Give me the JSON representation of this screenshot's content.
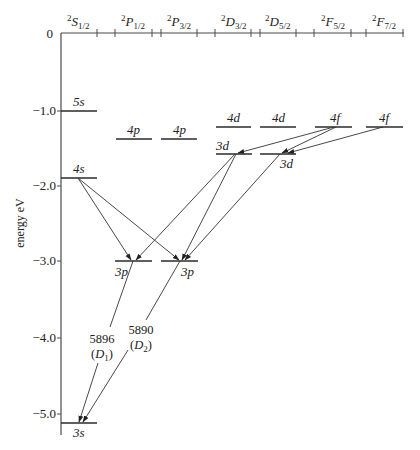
{
  "diagram": {
    "y_axis": {
      "label": "energy eV",
      "ticks": [
        {
          "label": "0",
          "value": 0
        },
        {
          "label": "−1.0",
          "value": -1.0
        },
        {
          "label": "−2.0",
          "value": -2.0
        },
        {
          "label": "−3.0",
          "value": -3.0
        },
        {
          "label": "−4.0",
          "value": -4.0
        },
        {
          "label": "−5.0",
          "value": -5.0
        }
      ]
    },
    "columns": [
      {
        "id": "S1/2",
        "sup": "2",
        "letter": "S",
        "sub": "1/2"
      },
      {
        "id": "P1/2",
        "sup": "2",
        "letter": "P",
        "sub": "1/2"
      },
      {
        "id": "P3/2",
        "sup": "2",
        "letter": "P",
        "sub": "3/2"
      },
      {
        "id": "D3/2",
        "sup": "2",
        "letter": "D",
        "sub": "3/2"
      },
      {
        "id": "D5/2",
        "sup": "2",
        "letter": "D",
        "sub": "5/2"
      },
      {
        "id": "F5/2",
        "sup": "2",
        "letter": "F",
        "sub": "5/2"
      },
      {
        "id": "F7/2",
        "sup": "2",
        "letter": "F",
        "sub": "7/2"
      }
    ],
    "levels": [
      {
        "label": "5s",
        "column": "S1/2",
        "energy_ev": -1.0
      },
      {
        "label": "4s",
        "column": "S1/2",
        "energy_ev": -1.95
      },
      {
        "label": "3s",
        "column": "S1/2",
        "energy_ev": -5.14
      },
      {
        "label": "4p",
        "column": "P1/2",
        "energy_ev": -1.39
      },
      {
        "label": "4p",
        "column": "P3/2",
        "energy_ev": -1.39
      },
      {
        "label": "3p",
        "column": "P1/2",
        "energy_ev": -3.03
      },
      {
        "label": "3p",
        "column": "P3/2",
        "energy_ev": -3.03
      },
      {
        "label": "4d",
        "column": "D3/2",
        "energy_ev": -0.87
      },
      {
        "label": "4d",
        "column": "D5/2",
        "energy_ev": -0.87
      },
      {
        "label": "3d",
        "column": "D3/2",
        "energy_ev": -1.52
      },
      {
        "label": "3d",
        "column": "D5/2",
        "energy_ev": -1.52
      },
      {
        "label": "4f",
        "column": "F5/2",
        "energy_ev": -0.85
      },
      {
        "label": "4f",
        "column": "F7/2",
        "energy_ev": -0.85
      }
    ],
    "transitions": [
      {
        "from": "4s (S1/2)",
        "to": "3p (P1/2)"
      },
      {
        "from": "4s (S1/2)",
        "to": "3p (P3/2)"
      },
      {
        "from": "3d (D3/2)",
        "to": "3p (P1/2)"
      },
      {
        "from": "3d (D3/2)",
        "to": "3p (P3/2)"
      },
      {
        "from": "3d (D5/2)",
        "to": "3p (P3/2)"
      },
      {
        "from": "4f (F5/2)",
        "to": "3d (D3/2)"
      },
      {
        "from": "4f (F5/2)",
        "to": "3d (D5/2)"
      },
      {
        "from": "4f (F7/2)",
        "to": "3d (D5/2)"
      },
      {
        "from": "3p (P1/2)",
        "to": "3s (S1/2)",
        "wavelength": "5896",
        "name": "D",
        "name_sub": "1"
      },
      {
        "from": "3p (P3/2)",
        "to": "3s (S1/2)",
        "wavelength": "5890",
        "name": "D",
        "name_sub": "2"
      }
    ],
    "d_lines": {
      "d1": {
        "wavelength": "5896",
        "open": "(",
        "letter": "D",
        "sub": "1",
        "close": ")"
      },
      "d2": {
        "wavelength": "5890",
        "open": "(",
        "letter": "D",
        "sub": "2",
        "close": ")"
      }
    },
    "colors": {
      "lines": "#2a2a2a",
      "text": "#222222",
      "background": "#ffffff"
    }
  }
}
